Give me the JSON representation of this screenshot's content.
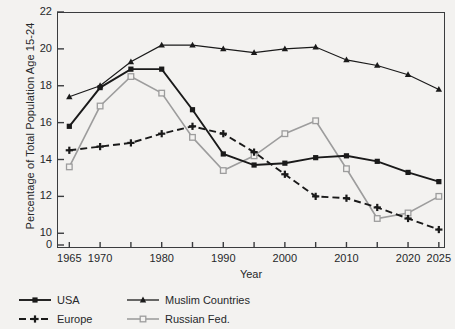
{
  "chart_data": {
    "type": "line",
    "title": "",
    "xlabel": "Year",
    "ylabel": "Percentage of Total Population Age 15-24",
    "x": [
      1965,
      1970,
      1975,
      1980,
      1985,
      1990,
      1995,
      2000,
      2005,
      2010,
      2015,
      2020,
      2025
    ],
    "xlim": [
      1963,
      2026
    ],
    "ylim": [
      9.2,
      22
    ],
    "y_axis_break": true,
    "yticks": [
      0,
      10,
      12,
      14,
      16,
      18,
      20,
      22
    ],
    "xticks": [
      1965,
      1970,
      1975,
      1980,
      1985,
      1990,
      1995,
      2000,
      2005,
      2010,
      2015,
      2020,
      2025
    ],
    "xtick_labels": [
      "1965",
      "1970",
      "",
      "1980",
      "",
      "1990",
      "",
      "2000",
      "",
      "2010",
      "",
      "2020",
      "2025"
    ],
    "grid": false,
    "legend_position": "below-left",
    "series": [
      {
        "name": "USA",
        "color": "#1a1a1a",
        "marker": "square",
        "dash": "solid",
        "values": [
          15.8,
          17.9,
          18.9,
          18.9,
          16.7,
          14.3,
          13.7,
          13.8,
          14.1,
          14.2,
          13.9,
          13.3,
          12.8
        ]
      },
      {
        "name": "Europe",
        "color": "#1a1a1a",
        "marker": "plus",
        "dash": "dashed",
        "values": [
          14.5,
          14.7,
          14.9,
          15.4,
          15.8,
          15.4,
          14.4,
          13.2,
          12.0,
          11.9,
          11.4,
          10.8,
          10.2
        ]
      },
      {
        "name": "Muslim Countries",
        "color": "#1a1a1a",
        "marker": "triangle",
        "dash": "solid",
        "values": [
          17.4,
          18.0,
          19.3,
          20.2,
          20.2,
          20.0,
          19.8,
          20.0,
          20.1,
          19.4,
          19.1,
          18.6,
          17.8
        ]
      },
      {
        "name": "Russian Fed.",
        "color": "#9d9d9d",
        "marker": "open-square",
        "dash": "solid",
        "values": [
          13.6,
          16.9,
          18.5,
          17.6,
          15.2,
          13.4,
          14.2,
          15.4,
          16.1,
          13.5,
          10.8,
          11.1,
          12.0
        ]
      }
    ]
  }
}
